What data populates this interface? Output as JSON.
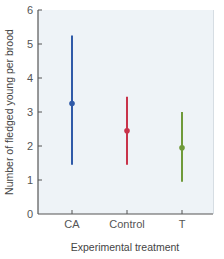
{
  "chart_data": {
    "type": "scatter",
    "title": "",
    "xlabel": "Experimental treatment",
    "ylabel": "Number of fledged young per brood",
    "ylim": [
      0,
      6
    ],
    "yticks": [
      0,
      1,
      2,
      3,
      4,
      5,
      6
    ],
    "categories": [
      "CA",
      "Control",
      "T"
    ],
    "series": [
      {
        "name": "CA",
        "mean": 3.25,
        "low": 1.45,
        "high": 5.25,
        "color": "#2f5aa8"
      },
      {
        "name": "Control",
        "mean": 2.45,
        "low": 1.45,
        "high": 3.45,
        "color": "#c8334a"
      },
      {
        "name": "T",
        "mean": 1.95,
        "low": 0.95,
        "high": 3.0,
        "color": "#6f9a3a"
      }
    ],
    "grid": false,
    "legend": null,
    "plot_background": "#eef3f7"
  }
}
